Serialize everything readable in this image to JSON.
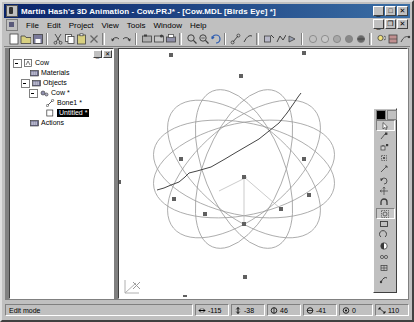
{
  "window": {
    "title": "Martin Hash's 3D Animation - Cow.PRJ* - [Cow.MDL [Birds Eye] *]",
    "app_icon": "app-icon",
    "buttons": {
      "minimize": "_",
      "maximize": "□",
      "close": "✕"
    }
  },
  "mdi": {
    "doc_icon": "document-icon",
    "buttons": {
      "minimize": "_",
      "restore": "❐",
      "close": "✕"
    }
  },
  "menu": [
    {
      "label": "File",
      "accel": "F"
    },
    {
      "label": "Edit",
      "accel": "E"
    },
    {
      "label": "Project",
      "accel": "P"
    },
    {
      "label": "View",
      "accel": "V"
    },
    {
      "label": "Tools",
      "accel": "T"
    },
    {
      "label": "Window",
      "accel": "W"
    },
    {
      "label": "Help",
      "accel": "H"
    }
  ],
  "toolbar": {
    "groups": [
      {
        "buttons": [
          {
            "name": "new-icon",
            "glyph": "new"
          },
          {
            "name": "open-icon",
            "glyph": "open"
          },
          {
            "name": "save-icon",
            "glyph": "save"
          }
        ]
      },
      {
        "buttons": [
          {
            "name": "cut-icon",
            "glyph": "cut"
          },
          {
            "name": "copy-icon",
            "glyph": "copy"
          },
          {
            "name": "paste-icon",
            "glyph": "paste"
          },
          {
            "name": "delete-icon",
            "glyph": "delete"
          }
        ]
      },
      {
        "buttons": [
          {
            "name": "undo-icon",
            "glyph": "undo"
          },
          {
            "name": "redo-icon",
            "glyph": "redo"
          }
        ]
      },
      {
        "buttons": [
          {
            "name": "render-icon",
            "glyph": "render"
          },
          {
            "name": "render-all-icon",
            "glyph": "render-all"
          },
          {
            "name": "print-icon",
            "glyph": "print"
          }
        ]
      },
      {
        "buttons": [
          {
            "name": "zoom-fit-icon",
            "glyph": "zoomfit"
          },
          {
            "name": "zoom-icon",
            "glyph": "zoom"
          },
          {
            "name": "rotate-icon",
            "glyph": "rotate"
          }
        ]
      },
      {
        "buttons": [
          {
            "name": "bone-mode-icon",
            "glyph": "bone"
          },
          {
            "name": "muscle-mode-icon",
            "glyph": "muscle"
          }
        ]
      },
      {
        "buttons": [
          {
            "name": "skeleton-icon",
            "glyph": "skeleton"
          },
          {
            "name": "action-icon",
            "glyph": "action"
          },
          {
            "name": "camera-icon",
            "glyph": "camera"
          }
        ]
      },
      {
        "buttons": [
          {
            "name": "shade-wire-icon",
            "glyph": "shade1"
          },
          {
            "name": "shade-flat-icon",
            "glyph": "shade2"
          },
          {
            "name": "shade-smooth-icon",
            "glyph": "shade3"
          },
          {
            "name": "shade-tex-icon",
            "glyph": "shade4"
          },
          {
            "name": "shade-final-icon",
            "glyph": "shade5"
          }
        ]
      },
      {
        "buttons": [
          {
            "name": "light-icon",
            "glyph": "light"
          },
          {
            "name": "material-icon",
            "glyph": "material"
          },
          {
            "name": "decal-icon",
            "glyph": "decal"
          }
        ]
      }
    ]
  },
  "tree": {
    "panel_buttons": {
      "minimize": "_",
      "close": "✕"
    },
    "nodes": [
      {
        "label": "Cow",
        "depth": 0,
        "expander": "minus",
        "icon": "project-icon",
        "selected": false
      },
      {
        "label": "Materials",
        "depth": 1,
        "expander": "none",
        "icon": "folder-icon",
        "selected": false
      },
      {
        "label": "Objects",
        "depth": 1,
        "expander": "minus",
        "icon": "folder-icon",
        "selected": false
      },
      {
        "label": "Cow *",
        "depth": 2,
        "expander": "minus",
        "icon": "model-icon",
        "selected": false
      },
      {
        "label": "Bone1 *",
        "depth": 3,
        "expander": "none",
        "icon": "bone-icon",
        "selected": false
      },
      {
        "label": "Untitled *",
        "depth": 3,
        "expander": "none",
        "icon": "mesh-icon",
        "selected": true
      },
      {
        "label": "Actions",
        "depth": 1,
        "expander": "none",
        "icon": "folder-icon",
        "selected": false
      }
    ]
  },
  "palette": {
    "header": [
      "swatch-dark",
      "swatch-light"
    ],
    "tools": [
      {
        "name": "tool-select",
        "glyph": "cursor",
        "active": true
      },
      {
        "name": "tool-add-point",
        "glyph": "addpoint",
        "active": false
      },
      {
        "name": "tool-add-lock",
        "glyph": "addlock",
        "active": false
      },
      {
        "name": "tool-group",
        "glyph": "group",
        "active": false
      },
      {
        "name": "tool-scale",
        "glyph": "scale",
        "active": false
      },
      {
        "name": "tool-rotate",
        "glyph": "rotatetool",
        "active": false
      },
      {
        "name": "tool-translate",
        "glyph": "translate",
        "active": false
      },
      {
        "name": "tool-magnet",
        "glyph": "magnet",
        "active": false
      },
      {
        "name": "tool-lathe",
        "glyph": "lathe",
        "active": true
      },
      {
        "name": "tool-rect",
        "glyph": "rect",
        "active": false
      },
      {
        "name": "tool-circle",
        "glyph": "circle",
        "active": false
      },
      {
        "name": "tool-sphere",
        "glyph": "sphere",
        "active": false
      },
      {
        "name": "tool-extrude",
        "glyph": "extrude",
        "active": false
      },
      {
        "name": "tool-grid",
        "glyph": "grid",
        "active": false
      },
      {
        "name": "tool-bone-add",
        "glyph": "boneadd",
        "active": false
      }
    ]
  },
  "statusbar": {
    "mode": "Edit mode",
    "fields": [
      {
        "name": "x-coordinate",
        "icon": "arrow-horizontal",
        "value": "-115"
      },
      {
        "name": "y-coordinate",
        "icon": "arrow-vertical",
        "value": "-38"
      },
      {
        "name": "rotate-x",
        "icon": "rotate-x",
        "value": "46"
      },
      {
        "name": "rotate-y",
        "icon": "rotate-y",
        "value": "-41"
      },
      {
        "name": "rotate-z",
        "icon": "rotate-z",
        "value": "0"
      },
      {
        "name": "zoom-level",
        "icon": "zoom-status",
        "value": "110"
      }
    ]
  },
  "viewport": {
    "name": "birds-eye-viewport",
    "axis_gizmo": "axis-gizmo",
    "colors": {
      "spline": "#9a9a9a",
      "active_spline": "#303030",
      "control_point": "#606060"
    },
    "splines": [
      {
        "name": "ellipse-1",
        "cx": 125,
        "cy": 120,
        "rx": 92,
        "ry": 46,
        "rot": 40
      },
      {
        "name": "ellipse-2",
        "cx": 125,
        "cy": 120,
        "rx": 92,
        "ry": 46,
        "rot": -40
      },
      {
        "name": "ellipse-3",
        "cx": 125,
        "cy": 120,
        "rx": 92,
        "ry": 46,
        "rot": 12
      },
      {
        "name": "ellipse-4",
        "cx": 125,
        "cy": 120,
        "rx": 92,
        "ry": 46,
        "rot": -12
      },
      {
        "name": "ellipse-5",
        "cx": 125,
        "cy": 120,
        "rx": 84,
        "ry": 40,
        "rot": 68
      },
      {
        "name": "ellipse-6",
        "cx": 125,
        "cy": 120,
        "rx": 84,
        "ry": 40,
        "rot": -68
      }
    ],
    "active_path": "M 38 141 L 45 139 L 52 136 L 60 133 L 66 128 L 70 124 L 78 122 L 92 118 L 106 110 L 116 104 L 128 97 L 140 90 L 150 82 L 160 74 L 168 64 L 175 54 L 179 48 L 182 44",
    "bone_lines": [
      {
        "name": "bone-line-1",
        "x1": 125,
        "y1": 175,
        "x2": 125,
        "y2": 128
      },
      {
        "name": "bone-line-2",
        "x1": 125,
        "y1": 128,
        "x2": 162,
        "y2": 160
      },
      {
        "name": "bone-line-3",
        "x1": 100,
        "y1": 142,
        "x2": 128,
        "y2": 128
      }
    ],
    "control_points": [
      {
        "x": 52,
        "y": 6
      },
      {
        "x": 185,
        "y": 4
      },
      {
        "x": 122,
        "y": 27
      },
      {
        "x": 62,
        "y": 110
      },
      {
        "x": 185,
        "y": 110
      },
      {
        "x": 55,
        "y": 150
      },
      {
        "x": 190,
        "y": 146
      },
      {
        "x": 125,
        "y": 128
      },
      {
        "x": 162,
        "y": 160
      },
      {
        "x": 125,
        "y": 175
      },
      {
        "x": 86,
        "y": 165
      },
      {
        "x": 0,
        "y": 133
      },
      {
        "x": 126,
        "y": 228
      },
      {
        "x": 66,
        "y": 248
      }
    ]
  }
}
